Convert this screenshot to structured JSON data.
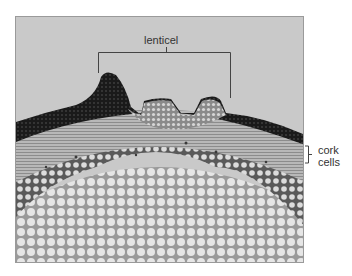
{
  "figure": {
    "type": "micrograph",
    "background_color": "#c9c9c9",
    "labels": {
      "lenticel": "lenticel",
      "cork_line1": "cork",
      "cork_line2": "cells"
    }
  }
}
